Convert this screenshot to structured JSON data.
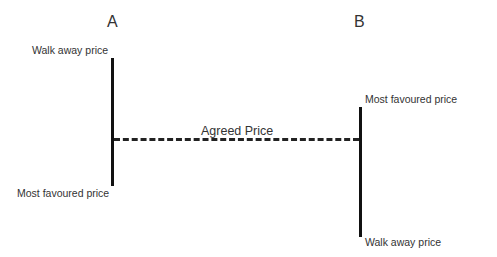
{
  "diagram": {
    "party_a": {
      "label": "A",
      "top": "Walk away price",
      "bottom": "Most favoured price"
    },
    "party_b": {
      "label": "B",
      "top": "Most favoured price",
      "bottom": "Walk away price"
    },
    "agreed": "Agreed Price"
  }
}
